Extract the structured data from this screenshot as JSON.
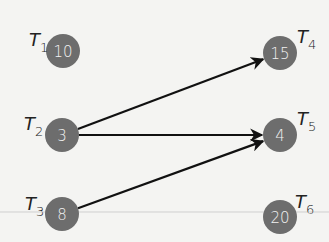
{
  "nodes": [
    {
      "id": "T1",
      "label": "T",
      "sub": "1",
      "value": "10",
      "cx": 63,
      "cy": 51,
      "lx": 29,
      "ly": 46
    },
    {
      "id": "T2",
      "label": "T",
      "sub": "2",
      "value": "3",
      "cx": 62,
      "cy": 135,
      "lx": 24,
      "ly": 130
    },
    {
      "id": "T3",
      "label": "T",
      "sub": "3",
      "value": "8",
      "cx": 62,
      "cy": 214,
      "lx": 25,
      "ly": 210
    },
    {
      "id": "T4",
      "label": "T",
      "sub": "4",
      "value": "15",
      "cx": 280,
      "cy": 53,
      "lx": 297,
      "ly": 43
    },
    {
      "id": "T5",
      "label": "T",
      "sub": "5",
      "value": "4",
      "cx": 280,
      "cy": 135,
      "lx": 297,
      "ly": 125
    },
    {
      "id": "T6",
      "label": "T",
      "sub": "6",
      "value": "20",
      "cx": 280,
      "cy": 217,
      "lx": 295,
      "ly": 208
    }
  ],
  "edges": [
    {
      "from": "T2",
      "to": "T4"
    },
    {
      "from": "T2",
      "to": "T5"
    },
    {
      "from": "T3",
      "to": "T5"
    }
  ],
  "colors": {
    "node": "#6d6d6d",
    "edge": "#111111",
    "background": "#f4f4f2",
    "rule": "#c8c8c8"
  }
}
